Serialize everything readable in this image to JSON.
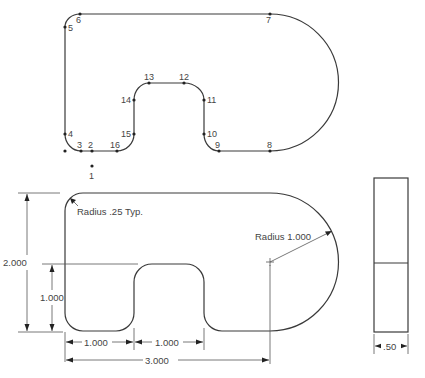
{
  "top_view": {
    "points": [
      {
        "id": "1",
        "label": "1",
        "x": 92,
        "y": 166,
        "lx": 89,
        "ly": 179
      },
      {
        "id": "2",
        "label": "2",
        "x": 92,
        "y": 151,
        "lx": 88,
        "ly": 148
      },
      {
        "id": "3",
        "label": "3",
        "x": 81,
        "y": 151,
        "lx": 77,
        "ly": 148
      },
      {
        "id": "4",
        "label": "4",
        "x": 65,
        "y": 134,
        "lx": 68,
        "ly": 137
      },
      {
        "id": "5",
        "label": "5",
        "x": 65,
        "y": 27,
        "lx": 68,
        "ly": 31
      },
      {
        "id": "6",
        "label": "6",
        "x": 80,
        "y": 14,
        "lx": 76,
        "ly": 23
      },
      {
        "id": "7",
        "label": "7",
        "x": 270,
        "y": 14,
        "lx": 266,
        "ly": 23
      },
      {
        "id": "8",
        "label": "8",
        "x": 270,
        "y": 151,
        "lx": 267,
        "ly": 148
      },
      {
        "id": "9",
        "label": "9",
        "x": 219,
        "y": 151,
        "lx": 215,
        "ly": 148
      },
      {
        "id": "10",
        "label": "10",
        "x": 204,
        "y": 134,
        "lx": 207,
        "ly": 137
      },
      {
        "id": "11",
        "label": "11",
        "x": 204,
        "y": 100,
        "lx": 207,
        "ly": 103
      },
      {
        "id": "12",
        "label": "12",
        "x": 184,
        "y": 83,
        "lx": 179,
        "ly": 80
      },
      {
        "id": "13",
        "label": "13",
        "x": 149,
        "y": 83,
        "lx": 144,
        "ly": 80
      },
      {
        "id": "14",
        "label": "14",
        "x": 134,
        "y": 100,
        "lx": 121,
        "ly": 103
      },
      {
        "id": "15",
        "label": "15",
        "x": 134,
        "y": 134,
        "lx": 121,
        "ly": 137
      },
      {
        "id": "16",
        "label": "16",
        "x": 117,
        "y": 151,
        "lx": 110,
        "ly": 148
      }
    ],
    "origin_marker": {
      "x": 65,
      "y": 151
    }
  },
  "front_view": {
    "annotations": {
      "corner_radius": "Radius .25 Typ.",
      "arc_radius": "Radius 1.000"
    },
    "dimensions": {
      "overall_height": "2.000",
      "notch_height": "1.000",
      "left_leg_width": "1.000",
      "notch_width": "1.000",
      "center_distance": "3.000"
    }
  },
  "side_view": {
    "thickness": ".50"
  }
}
